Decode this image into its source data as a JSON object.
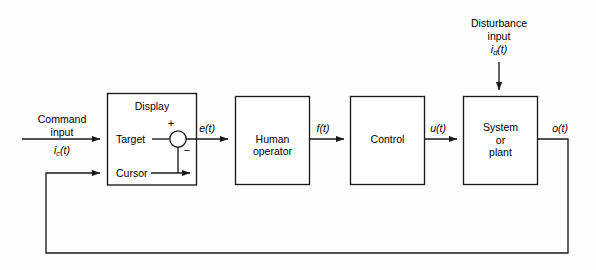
{
  "diagram": {
    "line_color": "#1a1a1a",
    "background_color": "#fefefe",
    "text_color": "#000000",
    "blocks": [
      {
        "id": "display",
        "label_top": "Display",
        "row_labels": [
          "Target",
          "Cursor"
        ]
      },
      {
        "id": "human-operator",
        "line1": "Human",
        "line2": "operator"
      },
      {
        "id": "control",
        "line1": "Control"
      },
      {
        "id": "system-plant",
        "line1": "System",
        "line2": "or",
        "line3": "plant"
      }
    ],
    "inputs": {
      "command": {
        "line1": "Command",
        "line2": "input",
        "symbol_base": "i",
        "symbol_sub": "c",
        "symbol_arg": "(t)"
      },
      "disturbance": {
        "line1": "Disturbance",
        "line2": "input",
        "symbol_base": "i",
        "symbol_sub": "d",
        "symbol_arg": "(t)"
      }
    },
    "signals": [
      {
        "id": "error",
        "label": "e(t)"
      },
      {
        "id": "force",
        "label": "f(t)"
      },
      {
        "id": "control-output",
        "label": "u(t)"
      },
      {
        "id": "output",
        "label": "o(t)"
      }
    ],
    "summing_junction": {
      "plus_sign": "+",
      "minus_sign": "−"
    }
  }
}
